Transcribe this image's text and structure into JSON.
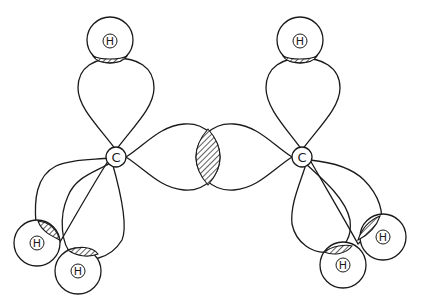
{
  "diagram": {
    "title": "",
    "atoms": {
      "carbon_left": {
        "label": "C"
      },
      "carbon_right": {
        "label": "C"
      },
      "h_top_left": {
        "label": "H"
      },
      "h_top_right": {
        "label": "H"
      },
      "h_bottom_left_1": {
        "label": "H"
      },
      "h_bottom_left_2": {
        "label": "H"
      },
      "h_bottom_right_1": {
        "label": "H"
      },
      "h_bottom_right_2": {
        "label": "H"
      }
    },
    "colors": {
      "line": "#1a1a1a",
      "background": "#ffffff"
    }
  }
}
